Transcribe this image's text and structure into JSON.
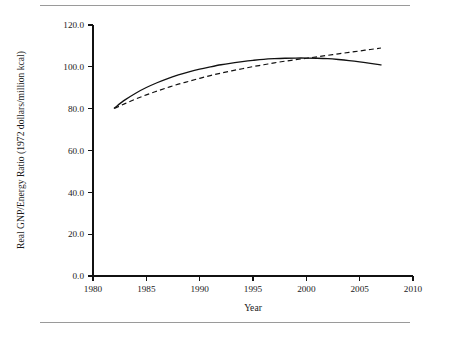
{
  "figure": {
    "background": "#ffffff",
    "ink_color": "#111111",
    "rule_color": "#9a9a9a",
    "has_top_rule": true,
    "has_bottom_rule": true
  },
  "chart_data": {
    "type": "line",
    "title": "",
    "subtitle": "",
    "xlabel": "Year",
    "ylabel": "Real GNP/Energy Ratio (1972 dollars/million kcal)",
    "xlim": [
      1980,
      2010
    ],
    "ylim": [
      0.0,
      120.0
    ],
    "xticks": [
      1980,
      1985,
      1990,
      1995,
      2000,
      2005,
      2010
    ],
    "xtick_labels": [
      "1980",
      "1985",
      "1990",
      "1995",
      "2000",
      "2005",
      "2010"
    ],
    "yticks": [
      0.0,
      20.0,
      40.0,
      60.0,
      80.0,
      100.0,
      120.0
    ],
    "ytick_labels": [
      "0.0",
      "20.0",
      "40.0",
      "60.0",
      "80.0",
      "100.0",
      "120.0"
    ],
    "grid": false,
    "legend": null,
    "legend_position": "none",
    "annotations": [],
    "series": [
      {
        "name": "solid-curve",
        "style": "solid",
        "color": "#111111",
        "x": [
          1982,
          1983,
          1984,
          1985,
          1986,
          1987,
          1988,
          1989,
          1990,
          1991,
          1992,
          1993,
          1994,
          1995,
          1996,
          1997,
          1998,
          1999,
          2000,
          2001,
          2002,
          2003,
          2004,
          2005,
          2006,
          2007
        ],
        "values": [
          80.3,
          84.2,
          87.4,
          90.1,
          92.4,
          94.4,
          96.1,
          97.6,
          98.9,
          100.0,
          101.0,
          101.8,
          102.5,
          103.1,
          103.6,
          103.9,
          104.1,
          104.2,
          104.2,
          104.1,
          103.9,
          103.5,
          103.0,
          102.4,
          101.7,
          100.9
        ]
      },
      {
        "name": "dashed-curve",
        "style": "dashed",
        "color": "#111111",
        "x": [
          1982,
          1983,
          1984,
          1985,
          1986,
          1987,
          1988,
          1989,
          1990,
          1991,
          1992,
          1993,
          1994,
          1995,
          1996,
          1997,
          1998,
          1999,
          2000,
          2001,
          2002,
          2003,
          2004,
          2005,
          2006,
          2007
        ],
        "values": [
          80.1,
          82.4,
          84.6,
          86.6,
          88.4,
          90.1,
          91.7,
          93.1,
          94.5,
          95.8,
          97.0,
          98.1,
          99.1,
          100.1,
          101.0,
          101.9,
          102.7,
          103.4,
          104.1,
          104.8,
          105.5,
          106.2,
          106.9,
          107.6,
          108.3,
          109.0
        ]
      }
    ],
    "crossing_point": {
      "x": 2001.5,
      "y": 104.2
    }
  },
  "geometry": {
    "plot_left_px": 93,
    "plot_right_px": 413,
    "plot_top_px": 25,
    "plot_bottom_px": 276
  }
}
